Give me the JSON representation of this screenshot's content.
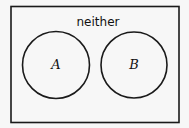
{
  "diagram": {
    "type": "venn",
    "universe_label": "neither",
    "sets": [
      {
        "label": "A"
      },
      {
        "label": "B"
      }
    ],
    "colors": {
      "stroke": "#1a1a1a",
      "background": "#f7f7f7"
    }
  }
}
